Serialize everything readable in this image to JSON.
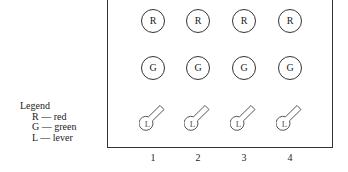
{
  "legend": {
    "title": "Legend",
    "items": [
      {
        "key": "R",
        "label": "R — red"
      },
      {
        "key": "G",
        "label": "G — green"
      },
      {
        "key": "L",
        "label": "L — lever"
      }
    ]
  },
  "rows": {
    "red": [
      "R",
      "R",
      "R",
      "R"
    ],
    "green": [
      "G",
      "G",
      "G",
      "G"
    ],
    "lever": [
      "L",
      "L",
      "L",
      "L"
    ]
  },
  "columns": [
    "1",
    "2",
    "3",
    "4"
  ]
}
